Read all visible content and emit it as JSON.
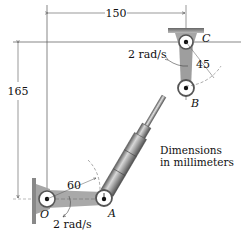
{
  "dimensions": {
    "horizontal": "150",
    "vertical": "165",
    "angle_O": "60",
    "angle_C": "45"
  },
  "angular_velocities": {
    "at_C": "2 rad/s",
    "at_O": "2 rad/s"
  },
  "points": {
    "O": "O",
    "A": "A",
    "B": "B",
    "C": "C"
  },
  "note": {
    "line1": "Dimensions",
    "line2": "in millimeters"
  },
  "colors": {
    "link_fill": "#a9a9a9",
    "cylinder_fill": "#8f8f8f",
    "support_fill": "#9a9a9a",
    "line": "#333333"
  }
}
